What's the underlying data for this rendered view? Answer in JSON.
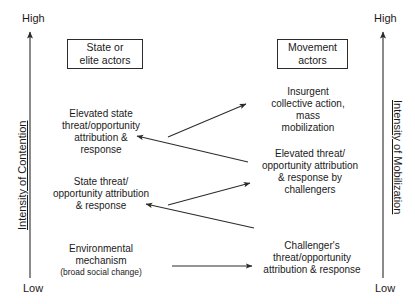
{
  "diagram": {
    "title_left_box": "State or\nelite actors",
    "title_right_box": "Movement\nactors",
    "axes": {
      "left": {
        "title": "Intensity of Contention",
        "high_label": "High",
        "low_label": "Low"
      },
      "right": {
        "title": "Intensity of Mobilization",
        "high_label": "High",
        "low_label": "Low"
      }
    },
    "boxes": [
      {
        "id": "state-actors",
        "line1": "State or",
        "line2": "elite actors"
      },
      {
        "id": "movement-actors",
        "line1": "Movement",
        "line2": "actors"
      }
    ],
    "nodes": [
      {
        "id": "elevated-state-threat",
        "side": "left",
        "lines": [
          "Elevated state",
          "threat/opportunity",
          "attribution &",
          "response"
        ],
        "sub": ""
      },
      {
        "id": "state-threat",
        "side": "left",
        "lines": [
          "State threat/",
          "opportunity attribution",
          "&  response"
        ],
        "sub": ""
      },
      {
        "id": "environmental-mechanism",
        "side": "left",
        "lines": [
          "Environmental",
          "mechanism"
        ],
        "sub": "(broad social change)"
      },
      {
        "id": "insurgent-collective-action",
        "side": "right",
        "lines": [
          "Insurgent",
          "collective action,",
          "mass",
          "mobilization"
        ],
        "sub": ""
      },
      {
        "id": "elevated-threat-challengers",
        "side": "right",
        "lines": [
          "Elevated threat/",
          "opportunity attribution",
          "&  response by",
          "challengers"
        ],
        "sub": ""
      },
      {
        "id": "challengers-threat",
        "side": "right",
        "lines": [
          "Challenger's",
          "threat/opportunity",
          "attribution & response"
        ],
        "sub": ""
      }
    ],
    "arrows": [
      {
        "id": "arrow-state-threat-to-insurgent",
        "from": "state-threat",
        "to": "insurgent-collective-action",
        "direction": "right-up"
      },
      {
        "id": "arrow-elevated-threat-to-elevated-state",
        "from": "elevated-threat-challengers",
        "to": "elevated-state-threat",
        "direction": "left-up"
      },
      {
        "id": "arrow-challengers-threat-to-elevated-threat",
        "from": "challengers-threat",
        "to": "elevated-threat-challengers",
        "direction": "right-up"
      },
      {
        "id": "arrow-challengers-to-state-threat",
        "from": "challengers-threat",
        "to": "state-threat",
        "direction": "left-up"
      },
      {
        "id": "arrow-environmental-to-challengers",
        "from": "environmental-mechanism",
        "to": "challengers-threat",
        "direction": "right"
      }
    ]
  }
}
